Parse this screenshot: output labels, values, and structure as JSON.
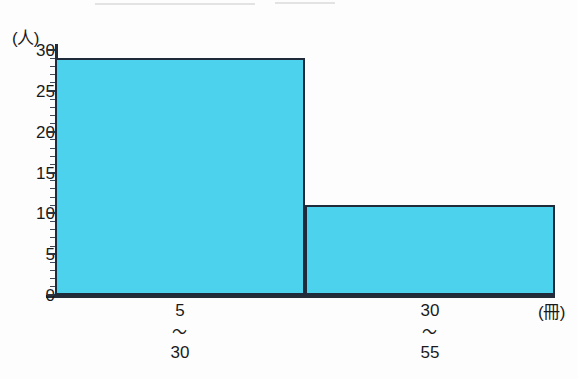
{
  "chart_data": {
    "type": "bar",
    "title": "",
    "subtitle": "",
    "xlabel": "冊",
    "ylabel": "人",
    "x_unit_caption": "(冊)",
    "y_unit_caption": "(人)",
    "categories": [
      "5\n〜\n30",
      "30\n〜\n55"
    ],
    "category_parts": [
      {
        "from": "5",
        "tilde": "〜",
        "to": "30"
      },
      {
        "from": "30",
        "tilde": "〜",
        "to": "55"
      }
    ],
    "values": [
      29,
      11
    ],
    "ylim": [
      0,
      30
    ],
    "y_major_step": 5,
    "y_minor_step": 1,
    "y_ticks": [
      "0",
      "5",
      "10",
      "15",
      "20",
      "25",
      "30"
    ],
    "grid": false,
    "legend": false,
    "legend_position": "none",
    "bar_fill_color": "#4dd2ee",
    "bar_outline_color": "#1f2a3a",
    "axis_color": "#232b38",
    "bar_edges": [
      5,
      30,
      55
    ],
    "bars": [
      {
        "label": "5〜30",
        "value": 29,
        "x_start": 5,
        "x_end": 30
      },
      {
        "label": "30〜55",
        "value": 11,
        "x_start": 30,
        "x_end": 55
      }
    ]
  }
}
